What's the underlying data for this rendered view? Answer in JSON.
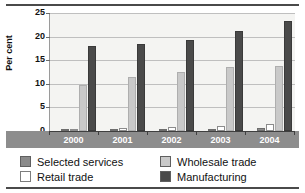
{
  "chart_data": {
    "type": "bar",
    "title": "",
    "subtitle": "",
    "xlabel": "",
    "ylabel": "Per cent",
    "categories": [
      "2000",
      "2001",
      "2002",
      "2003",
      "2004"
    ],
    "ylim": [
      0,
      25
    ],
    "yticks": [
      0,
      5,
      10,
      15,
      20,
      25
    ],
    "ytick_labels": [
      "0",
      "5",
      "10",
      "15",
      "20",
      "25"
    ],
    "grid": true,
    "legend_position": "bottom",
    "series": [
      {
        "name": "Selected services",
        "color": "#8a8a8a",
        "values": [
          0.4,
          0.4,
          0.4,
          0.4,
          0.6
        ]
      },
      {
        "name": "Retail trade",
        "color": "#ffffff",
        "values": [
          0.3,
          0.6,
          0.9,
          1.1,
          1.4
        ]
      },
      {
        "name": "Wholesale trade",
        "color": "#c9c9c9",
        "values": [
          9.7,
          11.5,
          12.5,
          13.6,
          13.8
        ]
      },
      {
        "name": "Manufacturing",
        "color": "#4a4a4a",
        "values": [
          18.0,
          18.4,
          19.3,
          21.2,
          23.4
        ]
      }
    ]
  },
  "legend": {
    "items": [
      {
        "label": "Selected services",
        "color": "#8a8a8a"
      },
      {
        "label": "Wholesale trade",
        "color": "#c9c9c9"
      },
      {
        "label": "Retail trade",
        "color": "#ffffff"
      },
      {
        "label": "Manufacturing",
        "color": "#4a4a4a"
      }
    ]
  }
}
